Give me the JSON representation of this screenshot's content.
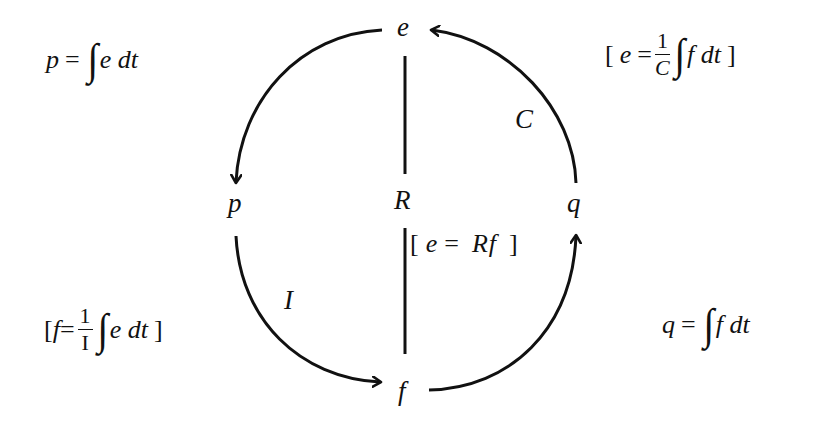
{
  "diagram": {
    "type": "bond-graph tetrahedron of state (circular form)",
    "nodes": {
      "e": "e",
      "p": "p",
      "f": "f",
      "q": "q"
    },
    "elements": {
      "R": "R",
      "C": "C",
      "I": "I"
    },
    "edges": [
      {
        "from": "e",
        "to": "p",
        "kind": "arrow",
        "label": ""
      },
      {
        "from": "p",
        "to": "f",
        "kind": "arrow",
        "label": "I"
      },
      {
        "from": "f",
        "to": "q",
        "kind": "arrow",
        "label": ""
      },
      {
        "from": "q",
        "to": "e",
        "kind": "arrow",
        "label": "C"
      },
      {
        "from": "e",
        "to": "f",
        "kind": "line",
        "label": "R"
      }
    ],
    "equations": {
      "top_left": {
        "lhs": "p",
        "eq": "=",
        "int": "∫",
        "body": "e dt"
      },
      "top_right": {
        "open": "[",
        "lhs": "e",
        "eq": "=",
        "num": "1",
        "den": "C",
        "int": "∫",
        "body": "f dt",
        "close": "]"
      },
      "middle": {
        "open": "[",
        "lhs": "e",
        "eq": "=",
        "rhs": "Rf",
        "close": "]"
      },
      "bottom_left": {
        "open": "[",
        "lhs": "f",
        "eq": "=",
        "num": "1",
        "den": "I",
        "int": "∫",
        "body": "e dt",
        "close": "]"
      },
      "bottom_right": {
        "lhs": "q",
        "eq": "=",
        "int": "∫",
        "body": "f dt"
      }
    },
    "stroke_color": "#111111",
    "background_color": "#ffffff"
  }
}
